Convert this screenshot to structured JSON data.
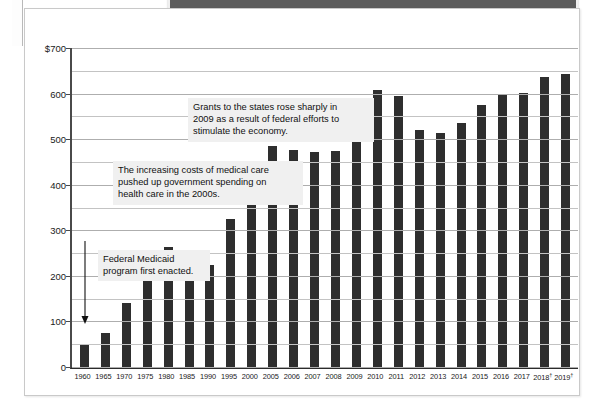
{
  "page": {
    "top_band_label": ""
  },
  "chart_data": {
    "type": "bar",
    "title": "",
    "xlabel": "",
    "ylabel": "",
    "ylim": [
      0,
      700
    ],
    "ytick_values": [
      0,
      100,
      200,
      300,
      400,
      500,
      600,
      700
    ],
    "ytick_labels": [
      "0",
      "100",
      "200",
      "300",
      "400",
      "500",
      "600",
      "$700"
    ],
    "gridline_step": 50,
    "grid": true,
    "legend": "none",
    "bar_color": "#2e2e2e",
    "categories": [
      "1960",
      "1965",
      "1970",
      "1975",
      "1980",
      "1985",
      "1990",
      "1995",
      "2000",
      "2005",
      "2006",
      "2007",
      "2008",
      "2009",
      "2010",
      "2011",
      "2012",
      "2013",
      "2014",
      "2015",
      "2016",
      "2017",
      "2018†",
      "2019†"
    ],
    "values": [
      50,
      75,
      140,
      213,
      263,
      215,
      223,
      325,
      372,
      485,
      477,
      472,
      473,
      543,
      608,
      595,
      519,
      514,
      536,
      575,
      598,
      602,
      636,
      643
    ],
    "annotations": [
      {
        "id": "grants-2009",
        "text": "Grants to the states rose sharply in\n2009 as a result of federal efforts to\nstimulate the economy.",
        "points_to": "2009"
      },
      {
        "id": "medical-costs",
        "text": "The increasing costs of medical care\npushed up government spending on\nhealth care in the 2000s.",
        "points_to": "2005"
      },
      {
        "id": "medicaid-enacted",
        "text": "Federal Medicaid\nprogram first enacted.",
        "points_to": "1965"
      }
    ],
    "footnote_marker": "†"
  }
}
